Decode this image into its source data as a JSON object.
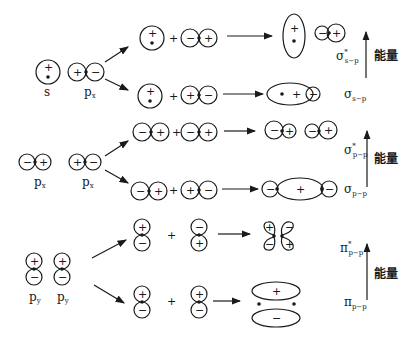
{
  "diagram": {
    "colors": {
      "ink": "#1a1a1a",
      "background": "#ffffff"
    },
    "signs": {
      "plus": "+",
      "minus": "−",
      "combine": "+"
    },
    "atomic_orbitals": {
      "row1": {
        "left": "s",
        "right": "p",
        "right_sub": "x"
      },
      "row2": {
        "left": "p",
        "left_sub": "x",
        "right": "p",
        "right_sub": "x"
      },
      "row3": {
        "left": "p",
        "left_sub": "y",
        "right": "p",
        "right_sub": "y"
      }
    },
    "molecular_orbitals": {
      "sigma_sp_star": {
        "symbol": "σ",
        "sup": "*",
        "sub": "s−p"
      },
      "sigma_sp": {
        "symbol": "σ",
        "sub": "s−p"
      },
      "sigma_pp_star": {
        "symbol": "σ",
        "sup": "*",
        "sub": "p−p"
      },
      "sigma_pp": {
        "symbol": "σ",
        "sub": "p−p"
      },
      "pi_pp_star": {
        "symbol": "π",
        "sup": "*",
        "sub": "p−p"
      },
      "pi_pp": {
        "symbol": "π",
        "sub": "p−p"
      }
    },
    "energy_axis": {
      "label": "能量",
      "count": 3
    }
  }
}
